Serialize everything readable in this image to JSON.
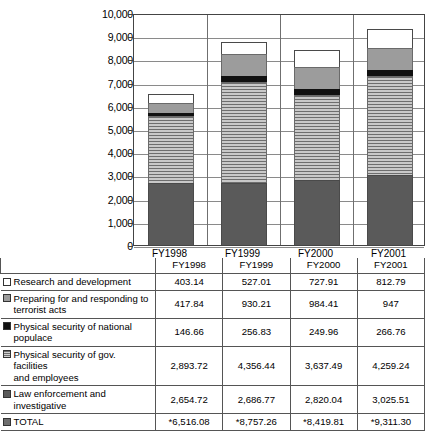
{
  "chart_data": {
    "type": "bar",
    "title": "",
    "xlabel": "",
    "ylabel": "",
    "stacked": true,
    "grid": true,
    "legend_position": "table-below",
    "ylim": [
      0,
      10000
    ],
    "ytick_step": 1000,
    "yticks": [
      "10,000",
      "9,000",
      "8,000",
      "7,000",
      "6,000",
      "5,000",
      "4,000",
      "3,000",
      "2,000",
      "1,000",
      "0"
    ],
    "categories": [
      "FY1998",
      "FY1999",
      "FY2000",
      "FY2001"
    ],
    "series": [
      {
        "name": "Law enforcement and investigative",
        "values": [
          2654.72,
          2686.77,
          2820.04,
          3025.51
        ],
        "swatch": "law"
      },
      {
        "name": "Physical security of gov. facilities and employees",
        "values": [
          2893.72,
          4356.44,
          3637.49,
          4259.24
        ],
        "swatch": "gov"
      },
      {
        "name": "Physical security of national populace",
        "values": [
          146.66,
          256.83,
          249.96,
          266.76
        ],
        "swatch": "nat"
      },
      {
        "name": "Preparing for and responding to terrorist acts",
        "values": [
          417.84,
          930.21,
          984.41,
          947
        ],
        "swatch": "prep"
      },
      {
        "name": "Research and development",
        "values": [
          403.14,
          527.01,
          727.91,
          812.79
        ],
        "swatch": "rnd"
      }
    ],
    "totals": [
      6516.08,
      8757.26,
      8419.81,
      9311.3
    ]
  },
  "table": {
    "column_headers": [
      "FY1998",
      "FY1999",
      "FY2000",
      "FY2001"
    ],
    "rows": [
      {
        "label_line1": "Research and development",
        "label_line2": "",
        "swatch": "rnd",
        "values": [
          "403.14",
          "527.01",
          "727.91",
          "812.79"
        ]
      },
      {
        "label_line1": "Preparing for and responding to",
        "label_line2": "terrorist acts",
        "swatch": "prep",
        "values": [
          "417.84",
          "930.21",
          "984.41",
          "947"
        ]
      },
      {
        "label_line1": "Physical security of national",
        "label_line2": "populace",
        "swatch": "nat",
        "values": [
          "146.66",
          "256.83",
          "249.96",
          "266.76"
        ]
      },
      {
        "label_line1": "Physical security of gov. facilities",
        "label_line2": "and employees",
        "swatch": "gov",
        "values": [
          "2,893.72",
          "4,356.44",
          "3,637.49",
          "4,259.24"
        ]
      },
      {
        "label_line1": "Law enforcement and investigative",
        "label_line2": "",
        "swatch": "law",
        "values": [
          "2,654.72",
          "2,686.77",
          "2,820.04",
          "3,025.51"
        ]
      },
      {
        "label_line1": "TOTAL",
        "label_line2": "",
        "swatch": "total",
        "values": [
          "*6,516.08",
          "*8,757.26",
          "*8,419.81",
          "*9,311.30"
        ]
      }
    ]
  }
}
